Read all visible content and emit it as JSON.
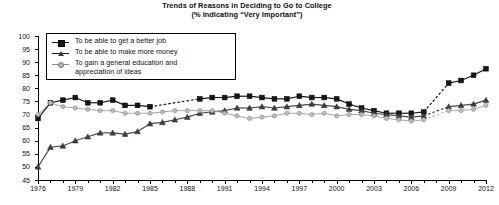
{
  "chart": {
    "title_line1": "Trends of Reasons in Deciding to Go to College",
    "title_line2": "(% Indicating “Very Important”)",
    "y_axis_title": "% of Students"
  },
  "legend": {
    "items": [
      {
        "label": "To be able to get a better job",
        "marker": "square-marker",
        "color": "#171717"
      },
      {
        "label": "To be able to make more money",
        "marker": "triangle-marker",
        "color": "#3a3a3a"
      },
      {
        "label": "To gain a general education and\nappreciation of ideas",
        "marker": "circle-marker",
        "color": "#b9b9b9"
      }
    ]
  },
  "chart_data": {
    "type": "line",
    "title": "Trends of Reasons in Deciding to Go to College (% Indicating “Very Important”)",
    "xlabel": "",
    "ylabel": "% of Students",
    "xlim": [
      1976,
      2012
    ],
    "ylim": [
      45,
      100
    ],
    "ytick_labels": [
      "100",
      "95",
      "90",
      "85",
      "80",
      "75",
      "70",
      "65",
      "60",
      "55",
      "50",
      "45"
    ],
    "ytick_values": [
      100,
      95,
      90,
      85,
      80,
      75,
      70,
      65,
      60,
      55,
      50,
      45
    ],
    "xtick_labels": [
      "1976",
      "1979",
      "1982",
      "1985",
      "1988",
      "1991",
      "1994",
      "1997",
      "2000",
      "2003",
      "2006",
      "2009",
      "2012"
    ],
    "xtick_values": [
      1976,
      1979,
      1982,
      1985,
      1988,
      1991,
      1994,
      1997,
      2000,
      2003,
      2006,
      2009,
      2012
    ],
    "minor_xticks_every": 1,
    "grid": false,
    "legend_position": "upper-left-inside",
    "x": [
      1976,
      1977,
      1978,
      1979,
      1980,
      1981,
      1982,
      1983,
      1984,
      1985,
      1986,
      1987,
      1988,
      1989,
      1990,
      1991,
      1992,
      1993,
      1994,
      1995,
      1996,
      1997,
      1998,
      1999,
      2000,
      2001,
      2002,
      2003,
      2004,
      2005,
      2006,
      2007,
      2008,
      2009,
      2010,
      2011,
      2012
    ],
    "series": [
      {
        "name": "To be able to get a better job",
        "marker": "square",
        "color": "#171717",
        "values": [
          68.5,
          74.5,
          75.5,
          76.5,
          74.5,
          74.5,
          75.5,
          73.5,
          73.5,
          73.0,
          null,
          null,
          null,
          76.0,
          76.5,
          76.5,
          77.0,
          77.0,
          76.5,
          76.0,
          76.0,
          77.0,
          76.5,
          76.5,
          76.0,
          74.0,
          72.5,
          71.5,
          70.5,
          70.5,
          70.5,
          71.0,
          null,
          82.0,
          83.0,
          85.0,
          87.5
        ],
        "gap_segments": [
          [
            1985,
            1989
          ],
          [
            2008,
            2009
          ]
        ],
        "gap_style": "dashed"
      },
      {
        "name": "To be able to make more money",
        "marker": "triangle",
        "color": "#3a3a3a",
        "values": [
          50.0,
          57.5,
          58.0,
          60.0,
          61.5,
          63.0,
          63.0,
          62.5,
          63.5,
          66.5,
          67.0,
          68.0,
          69.0,
          70.5,
          71.0,
          71.5,
          72.5,
          72.5,
          73.0,
          72.5,
          73.0,
          73.5,
          74.0,
          73.5,
          73.0,
          72.0,
          71.5,
          70.5,
          70.0,
          69.5,
          69.0,
          69.5,
          null,
          73.0,
          73.5,
          74.0,
          75.5
        ],
        "gap_segments": [
          [
            2008,
            2009
          ]
        ],
        "gap_style": "dashed"
      },
      {
        "name": "To gain a general education and appreciation of ideas",
        "marker": "circle",
        "color": "#b9b9b9",
        "values": [
          70.0,
          74.5,
          73.0,
          72.5,
          72.0,
          71.5,
          71.5,
          70.5,
          70.5,
          70.5,
          71.0,
          71.5,
          71.5,
          71.5,
          71.5,
          70.5,
          69.5,
          68.5,
          69.0,
          69.5,
          70.5,
          70.5,
          70.0,
          70.5,
          69.5,
          70.0,
          70.0,
          69.5,
          68.5,
          68.0,
          67.5,
          68.0,
          null,
          71.5,
          71.5,
          72.0,
          73.5
        ],
        "gap_segments": [
          [
            2008,
            2009
          ]
        ],
        "gap_style": "dashed"
      }
    ]
  }
}
